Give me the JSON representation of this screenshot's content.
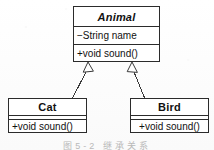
{
  "diagram": {
    "type": "uml-class-diagram",
    "background_color": "#fdfdfd",
    "line_color": "#2b2b2b",
    "text_color": "#111111",
    "caption": "图5-2  继承关系"
  },
  "classes": {
    "animal": {
      "name": "Animal",
      "stereotype": "abstract",
      "attributes": [
        "−String name"
      ],
      "operations": [
        "+void sound()"
      ]
    },
    "cat": {
      "name": "Cat",
      "stereotype": "concrete",
      "attributes": [],
      "operations": [
        "+void sound()"
      ]
    },
    "bird": {
      "name": "Bird",
      "stereotype": "concrete",
      "attributes": [],
      "operations": [
        "+void sound()"
      ]
    }
  },
  "relationships": [
    {
      "kind": "generalization",
      "from": "Cat",
      "to": "Animal",
      "arrowhead": "hollow-triangle"
    },
    {
      "kind": "generalization",
      "from": "Bird",
      "to": "Animal",
      "arrowhead": "hollow-triangle"
    }
  ]
}
